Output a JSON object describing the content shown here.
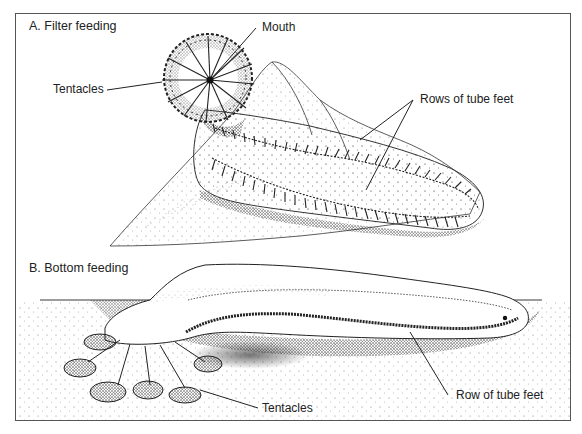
{
  "figure": {
    "panels": [
      {
        "id": "A",
        "title": "A.  Filter feeding",
        "labels": {
          "mouth": "Mouth",
          "tentacles": "Tentacles",
          "tube_feet": "Rows of tube feet"
        }
      },
      {
        "id": "B",
        "title": "B.  Bottom feeding",
        "labels": {
          "tentacles": "Tentacles",
          "tube_feet": "Row of tube feet"
        }
      }
    ],
    "colors": {
      "ink": "#222222",
      "border": "#555555",
      "background": "#ffffff"
    }
  }
}
